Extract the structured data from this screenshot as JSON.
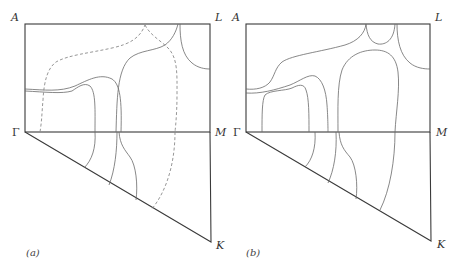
{
  "figure": {
    "panels": [
      {
        "id": "a",
        "caption": "(a)",
        "points": {
          "A": "A",
          "L": "L",
          "Gamma": "Γ",
          "M": "M",
          "K": "K"
        },
        "line_styles": [
          "solid",
          "dashed"
        ]
      },
      {
        "id": "b",
        "caption": "(b)",
        "points": {
          "A": "A",
          "L": "L",
          "Gamma": "Γ",
          "M": "M",
          "K": "K"
        },
        "line_styles": [
          "solid"
        ]
      }
    ]
  },
  "colors": {
    "frame": "#3a3a3a",
    "curve": "#6a6a6a",
    "dashed": "#8a8a8a",
    "background": "#ffffff"
  }
}
